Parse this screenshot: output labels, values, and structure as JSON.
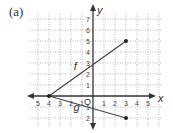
{
  "panel_label": "(a)",
  "chart_data": {
    "type": "line",
    "title": "",
    "xlabel": "x",
    "ylabel": "y",
    "origin_label": "O",
    "xlim": [
      -5.5,
      5.5
    ],
    "ylim": [
      -2.8,
      7.5
    ],
    "grid": true,
    "grid_style": "dotted",
    "x_ticks": [
      -5,
      -4,
      -3,
      -2,
      -1,
      1,
      2,
      3,
      4,
      5
    ],
    "x_tick_labels": [
      "5",
      "4",
      "3",
      "2",
      "1",
      "1",
      "2",
      "3",
      "4",
      "5"
    ],
    "y_ticks": [
      -2,
      -1,
      1,
      2,
      3,
      4,
      5,
      6,
      7
    ],
    "y_tick_labels": [
      "2",
      "1",
      "1",
      "2",
      "3",
      "4",
      "5",
      "6",
      "7"
    ],
    "series": [
      {
        "name": "f",
        "x": [
          -4,
          3
        ],
        "y": [
          0,
          5
        ],
        "endpoints": [
          "open-start",
          "dot"
        ],
        "label": "f",
        "label_pos": [
          -1.6,
          2.4
        ]
      },
      {
        "name": "g",
        "x": [
          -4,
          3
        ],
        "y": [
          0,
          -2
        ],
        "endpoints": [
          "dot",
          "dot"
        ],
        "label": "g",
        "label_pos": [
          -1.5,
          -1.4
        ]
      }
    ],
    "points": [
      {
        "x": -4,
        "y": 0
      },
      {
        "x": 3,
        "y": 5
      },
      {
        "x": 3,
        "y": -2
      }
    ],
    "legend": null,
    "colors": {
      "axis": "#333333",
      "grid": "#9a9a9a",
      "line": "#444444"
    }
  }
}
